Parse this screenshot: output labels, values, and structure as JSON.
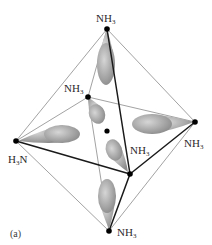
{
  "figure": {
    "caption": "(a)",
    "background": "#ffffff",
    "colors": {
      "thin_edge": "#8a8a8a",
      "thick_edge": "#1a1a1a",
      "vertex": "#000000",
      "lobe_light": "#d2d2d2",
      "lobe_dark": "#8c8c8c"
    }
  },
  "vertices": [
    {
      "id": "top",
      "x": 107,
      "y": 29,
      "label": {
        "main": "NH",
        "sub": "3",
        "suffix": "",
        "x": 96,
        "y": 13
      }
    },
    {
      "id": "back",
      "x": 88,
      "y": 97,
      "label": {
        "main": "NH",
        "sub": "3",
        "suffix": "",
        "x": 64,
        "y": 83
      }
    },
    {
      "id": "left",
      "x": 16,
      "y": 141,
      "label": {
        "main": "H",
        "sub": "3",
        "suffix": "N",
        "x": 8,
        "y": 154
      }
    },
    {
      "id": "right",
      "x": 195,
      "y": 122,
      "label": {
        "main": "NH",
        "sub": "3",
        "suffix": "",
        "x": 184,
        "y": 138
      }
    },
    {
      "id": "front",
      "x": 130,
      "y": 174,
      "label": {
        "main": "NH",
        "sub": "3",
        "suffix": "",
        "x": 130,
        "y": 145
      }
    },
    {
      "id": "bottom",
      "x": 109,
      "y": 231,
      "label": {
        "main": "NH",
        "sub": "3",
        "suffix": "",
        "x": 117,
        "y": 227
      }
    }
  ],
  "center": {
    "x": 107,
    "y": 131,
    "label": "Co"
  },
  "edges": {
    "thin": [
      [
        "top",
        "left"
      ],
      [
        "top",
        "back"
      ],
      [
        "top",
        "right"
      ],
      [
        "back",
        "left"
      ],
      [
        "back",
        "right"
      ],
      [
        "back",
        "bottom"
      ],
      [
        "left",
        "bottom"
      ],
      [
        "right",
        "bottom"
      ]
    ],
    "thick": [
      [
        "top",
        "front"
      ],
      [
        "left",
        "front"
      ],
      [
        "front",
        "right"
      ],
      [
        "front",
        "bottom"
      ]
    ]
  },
  "lobes": [
    {
      "id": "top-lobe",
      "cx": 106,
      "cy": 64,
      "rx": 9,
      "ry": 21,
      "angle": 0,
      "tip_x": 107,
      "tip_y": 30
    },
    {
      "id": "back-lobe",
      "cx": 97,
      "cy": 114,
      "rx": 8,
      "ry": 10,
      "angle": -20,
      "tip_x": 89,
      "tip_y": 98
    },
    {
      "id": "left-lobe",
      "cx": 62,
      "cy": 134,
      "rx": 18,
      "ry": 9,
      "angle": 0,
      "tip_x": 18,
      "tip_y": 141
    },
    {
      "id": "right-lobe",
      "cx": 152,
      "cy": 124,
      "rx": 20,
      "ry": 10,
      "angle": 0,
      "tip_x": 194,
      "tip_y": 122
    },
    {
      "id": "front-lobe",
      "cx": 114,
      "cy": 150,
      "rx": 8,
      "ry": 11,
      "angle": -20,
      "tip_x": 128,
      "tip_y": 172
    },
    {
      "id": "bottom-lobe",
      "cx": 107,
      "cy": 196,
      "rx": 9,
      "ry": 17,
      "angle": 0,
      "tip_x": 109,
      "tip_y": 229
    }
  ]
}
